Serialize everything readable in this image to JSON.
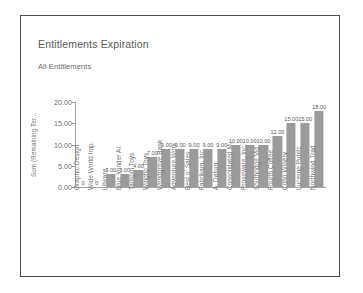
{
  "card": {
    "title": "Entitlements Expiration",
    "subtitle": "All Entitlements"
  },
  "chart_data": {
    "type": "bar",
    "title": "Entitlements Expiration",
    "subtitle": "All Entitlements",
    "xlabel": "",
    "ylabel": "Sum (Remaining Ter...",
    "ylim": [
      0,
      20
    ],
    "ytick_labels": [
      "0.00",
      "5.00",
      "10.00",
      "15.00",
      "20.00"
    ],
    "ytick_values": [
      0,
      5,
      10,
      15,
      20
    ],
    "grid": false,
    "legend": false,
    "bar_color": "#9b9b9b",
    "categories": [
      "Graphic Design",
      "Wide World Imp.",
      "Litware",
      "Blue Yonder Ai.",
      "Tailspin Toys",
      "Wingtip Toys",
      "Woodgrove Bank",
      "Adventure Work",
      "Best o' Sales",
      "Fabrikam, Inc.",
      "A. Datum",
      "Consolidated M.",
      "Proseware, Inc.",
      "Southridge Vid",
      "Fourth Coffee",
      "Coho Winery",
      "Lucerne Public",
      "Northwind Trad"
    ],
    "values": [
      0,
      0,
      3,
      3,
      4,
      7,
      9,
      9,
      9,
      9,
      9,
      10,
      10,
      10,
      12,
      15,
      15,
      18
    ],
    "data_labels": [
      "0",
      "0",
      "3.00",
      "3.00",
      "4.00",
      "7.00",
      "9.00",
      "9.00",
      "9.00",
      "9.00",
      "9.00",
      "10.00",
      "10.00",
      "10.00",
      "12.00",
      "15.00",
      "15.00",
      "18.00"
    ]
  }
}
